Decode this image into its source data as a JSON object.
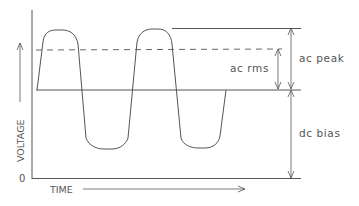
{
  "diagram": {
    "type": "waveform",
    "axes": {
      "y_label": "VOLTAGE",
      "x_label": "TIME",
      "origin_label": "0"
    },
    "annotations": {
      "ac_rms": "ac rms",
      "ac_peak": "ac peak",
      "dc_bias": "dc bias"
    },
    "colors": {
      "line": "#555555",
      "background": "#ffffff"
    }
  }
}
